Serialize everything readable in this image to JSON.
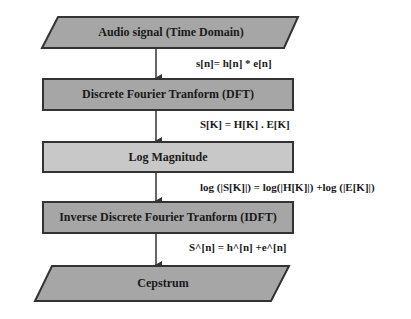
{
  "diagram": {
    "colors": {
      "dark_fill": "#a6a6a6",
      "light_fill": "#c8c8c8",
      "stroke": "#333333",
      "text": "#1a1a1a"
    },
    "nodes": [
      {
        "id": "input",
        "shape": "parallelogram",
        "label": "Audio signal (Time Domain)"
      },
      {
        "id": "dft",
        "shape": "rectangle",
        "label": "Discrete Fourier Tranform (DFT)"
      },
      {
        "id": "log",
        "shape": "rectangle",
        "label": "Log Magnitude"
      },
      {
        "id": "idft",
        "shape": "rectangle",
        "label": "Inverse Discrete Fourier Tranform (IDFT)"
      },
      {
        "id": "output",
        "shape": "parallelogram",
        "label": "Cepstrum"
      }
    ],
    "edges": [
      {
        "from": "input",
        "to": "dft",
        "label": "s[n]= h[n] * e[n]"
      },
      {
        "from": "dft",
        "to": "log",
        "label": "S[K] = H[K] . E[K]"
      },
      {
        "from": "log",
        "to": "idft",
        "label": "log (|S[K]|) = log(|H[K]|) +log (|E[K]|)"
      },
      {
        "from": "idft",
        "to": "output",
        "label": "S^[n] = h^[n] +e^[n]"
      }
    ]
  }
}
